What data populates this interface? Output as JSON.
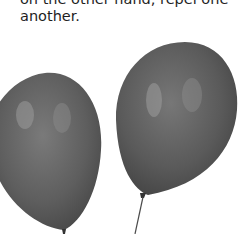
{
  "document": {
    "text_lines": [
      "on the other hand, repel one",
      "another."
    ]
  },
  "figure": {
    "balloons": [
      {
        "name": "left-balloon",
        "color": "#5e5e5e"
      },
      {
        "name": "right-balloon",
        "color": "#5a5a5a"
      }
    ]
  }
}
